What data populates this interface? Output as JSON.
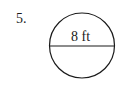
{
  "problem": {
    "number_label": "5."
  },
  "figure": {
    "shape": "circle",
    "measurement_label": "8 ft",
    "measured_segment": "diameter",
    "stroke_color": "#1a1a1a",
    "background_color": "#ffffff"
  }
}
